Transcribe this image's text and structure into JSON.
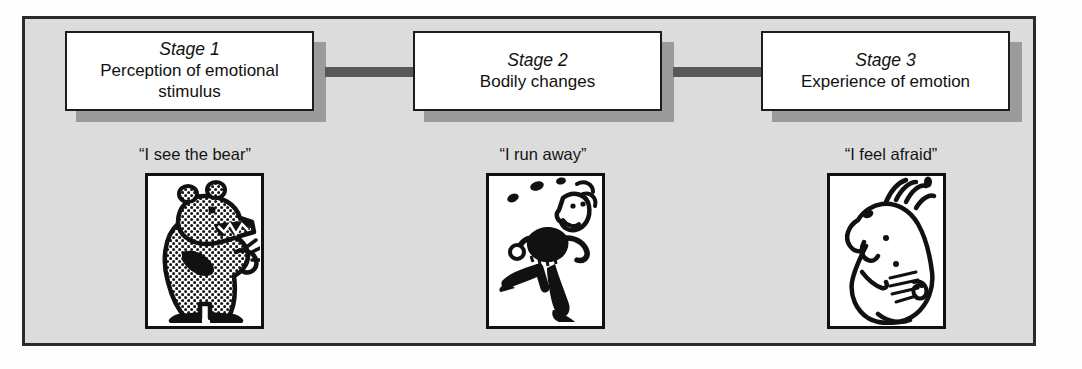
{
  "figure": {
    "panel_bg_color": "#dcdcdc",
    "panel_border_color": "#2b2b2b",
    "box_shadow_color": "#9b9b9b",
    "arrow_color": "#585858",
    "text_color": "#111111"
  },
  "stages": [
    {
      "stage_label": "Stage 1",
      "description": "Perception of emotional stimulus",
      "quote": "“I see the bear”",
      "illustration_name": "bear-illustration",
      "illustration_alt": "Cartoon bear standing upright with open mouth, halftone dot shading"
    },
    {
      "stage_label": "Stage 2",
      "description": "Bodily changes",
      "quote": "“I run away”",
      "illustration_name": "running-person-illustration",
      "illustration_alt": "Cartoon man running away with sweat drops flying from his head"
    },
    {
      "stage_label": "Stage 3",
      "description": "Experience of emotion",
      "quote": "“I feel afraid”",
      "illustration_name": "frightened-face-illustration",
      "illustration_alt": "Line drawing of a frightened face in profile with hair standing on end"
    }
  ],
  "arrows": [
    {
      "name": "arrow-stage1-to-stage2",
      "from": "Stage 1",
      "to": "Stage 2"
    },
    {
      "name": "arrow-stage2-to-stage3",
      "from": "Stage 2",
      "to": "Stage 3"
    }
  ]
}
